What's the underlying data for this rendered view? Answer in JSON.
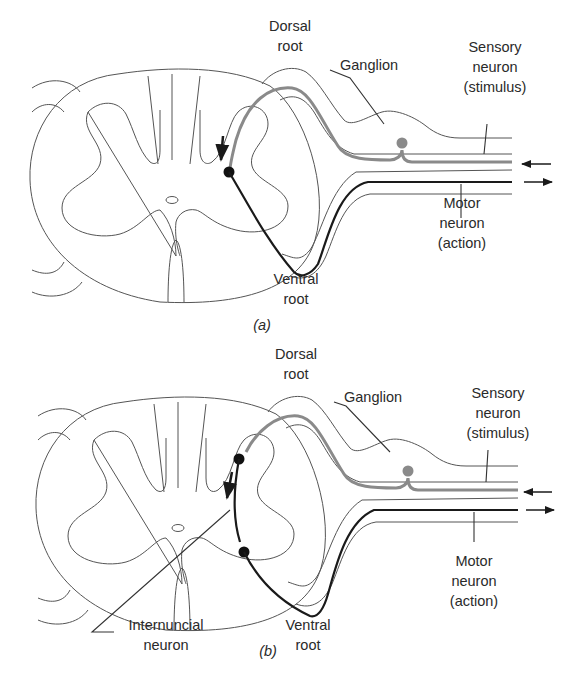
{
  "figure": {
    "panels": [
      {
        "id": "a",
        "caption": "(a)",
        "labels": {
          "dorsal_root": [
            "Dorsal",
            "root"
          ],
          "ganglion": "Ganglion",
          "sensory_neuron": [
            "Sensory",
            "neuron",
            "(stimulus)"
          ],
          "motor_neuron": [
            "Motor",
            "neuron",
            "(action)"
          ],
          "ventral_root": [
            "Ventral",
            "root"
          ]
        }
      },
      {
        "id": "b",
        "caption": "(b)",
        "labels": {
          "dorsal_root": [
            "Dorsal",
            "root"
          ],
          "ganglion": "Ganglion",
          "sensory_neuron": [
            "Sensory",
            "neuron",
            "(stimulus)"
          ],
          "motor_neuron": [
            "Motor",
            "neuron",
            "(action)"
          ],
          "ventral_root": [
            "Ventral",
            "root"
          ],
          "internuncial_neuron": [
            "Internuncial",
            "neuron"
          ]
        }
      }
    ],
    "colors": {
      "sensory_neuron": "#8a8a8a",
      "motor_neuron": "#1a1a1a",
      "outline": "#555555"
    }
  }
}
